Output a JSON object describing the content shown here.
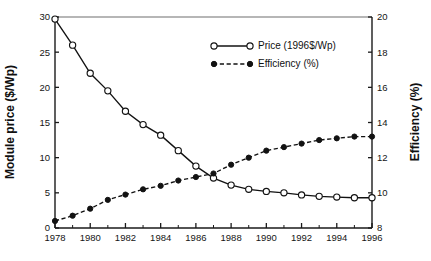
{
  "chart_data": {
    "type": "line",
    "title": "",
    "subtitle": "",
    "xlabel": "",
    "ylabel": "Module price ($/Wp)",
    "y2label": "Efficiency (%)",
    "xlim": [
      1978,
      1996
    ],
    "ylim": [
      0,
      30
    ],
    "y2lim": [
      8,
      20
    ],
    "grid": false,
    "legend_position": "upper-center-right",
    "x": [
      1978,
      1979,
      1980,
      1981,
      1982,
      1983,
      1984,
      1985,
      1986,
      1987,
      1988,
      1989,
      1990,
      1991,
      1992,
      1993,
      1994,
      1995,
      1996
    ],
    "xticklabels": [
      "1978",
      "1980",
      "1982",
      "1984",
      "1986",
      "1988",
      "1990",
      "1992",
      "1994",
      "1996"
    ],
    "xtickvalues": [
      1978,
      1980,
      1982,
      1984,
      1986,
      1988,
      1990,
      1992,
      1994,
      1996
    ],
    "xminorticks": [
      1979,
      1981,
      1983,
      1985,
      1987,
      1989,
      1991,
      1993,
      1995
    ],
    "yticklabels": [
      "0",
      "5",
      "10",
      "15",
      "20",
      "25",
      "30"
    ],
    "ytickvalues": [
      0,
      5,
      10,
      15,
      20,
      25,
      30
    ],
    "y2ticklabels": [
      "8",
      "10",
      "12",
      "14",
      "16",
      "18",
      "20"
    ],
    "y2tickvalues": [
      8,
      10,
      12,
      14,
      16,
      18,
      20
    ],
    "series": [
      {
        "name": "Price (1996$/Wp)",
        "axis": "left",
        "marker": "open-circle",
        "linestyle": "solid",
        "color": "#121212",
        "values": [
          29.7,
          26.0,
          22.0,
          19.5,
          16.6,
          14.7,
          13.2,
          11.0,
          8.8,
          7.1,
          6.1,
          5.5,
          5.2,
          5.0,
          4.7,
          4.5,
          4.4,
          4.3,
          4.3
        ]
      },
      {
        "name": "Efficiency (%)",
        "axis": "right",
        "marker": "filled-circle",
        "linestyle": "dashed",
        "color": "#121212",
        "values": [
          8.4,
          8.7,
          9.1,
          9.6,
          9.9,
          10.2,
          10.4,
          10.7,
          10.9,
          11.1,
          11.6,
          12.0,
          12.4,
          12.6,
          12.8,
          13.0,
          13.1,
          13.2,
          13.2
        ]
      }
    ],
    "legend": [
      {
        "label": "Price (1996$/Wp)",
        "marker": "open-circle",
        "linestyle": "solid"
      },
      {
        "label": "Efficiency (%)",
        "marker": "filled-circle",
        "linestyle": "dashed"
      }
    ]
  }
}
